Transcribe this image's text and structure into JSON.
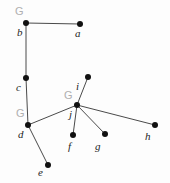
{
  "figure": {
    "kind": "node-link-graph",
    "width": 170,
    "height": 183,
    "background_color": "#fdfdfd",
    "node_color": "#111111",
    "edge_color": "#4a4a4a",
    "node_label_color": "#1d1d1d",
    "group_label_color": "#b0b0b0",
    "node_radius": 3
  },
  "nodes": [
    {
      "id": "a",
      "label": "a",
      "x": 80,
      "y": 24,
      "label_x": 75,
      "label_y": 28
    },
    {
      "id": "b",
      "label": "b",
      "x": 26,
      "y": 23,
      "label_x": 17,
      "label_y": 27
    },
    {
      "id": "c",
      "label": "c",
      "x": 26,
      "y": 78,
      "label_x": 16,
      "label_y": 82
    },
    {
      "id": "d",
      "label": "d",
      "x": 28,
      "y": 125,
      "label_x": 18,
      "label_y": 129
    },
    {
      "id": "e",
      "label": "e",
      "x": 48,
      "y": 165,
      "label_x": 38,
      "label_y": 167
    },
    {
      "id": "f",
      "label": "f",
      "x": 73,
      "y": 135,
      "label_x": 68,
      "label_y": 141
    },
    {
      "id": "g",
      "label": "g",
      "x": 105,
      "y": 134,
      "label_x": 95,
      "label_y": 141
    },
    {
      "id": "h",
      "label": "h",
      "x": 155,
      "y": 125,
      "label_x": 145,
      "label_y": 131
    },
    {
      "id": "i",
      "label": "i",
      "x": 88,
      "y": 77,
      "label_x": 76,
      "label_y": 81
    },
    {
      "id": "j",
      "label": "j",
      "x": 77,
      "y": 105,
      "label_x": 69,
      "label_y": 109
    }
  ],
  "edges": [
    {
      "from": "b",
      "to": "a"
    },
    {
      "from": "b",
      "to": "c"
    },
    {
      "from": "c",
      "to": "d"
    },
    {
      "from": "d",
      "to": "e"
    },
    {
      "from": "d",
      "to": "j"
    },
    {
      "from": "j",
      "to": "i"
    },
    {
      "from": "j",
      "to": "f"
    },
    {
      "from": "j",
      "to": "g"
    },
    {
      "from": "j",
      "to": "h"
    }
  ],
  "group_labels": [
    {
      "text": "G",
      "node": "b",
      "x": 15,
      "y": 6
    },
    {
      "text": "G",
      "node": "d",
      "x": 16,
      "y": 108
    },
    {
      "text": "G",
      "node": "j",
      "x": 64,
      "y": 90
    }
  ]
}
